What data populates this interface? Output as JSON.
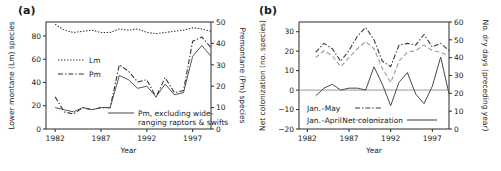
{
  "figure": {
    "panels": [
      {
        "label": "(a)",
        "xlabel": "Year",
        "y_left_label": "Lower montane (Lm) species",
        "y_right_label": "Premontane (Pm) species"
      },
      {
        "label": "(b)",
        "xlabel": "Year",
        "y_left_label": "Net colonization (no. species)",
        "y_right_label": "No. dry days (preceding year)"
      }
    ]
  },
  "chart_data": [
    {
      "type": "line",
      "title": "(a)",
      "xlabel": "Year",
      "ylabel": "Lower montane (Lm) species",
      "y2label": "Premontane (Pm) species",
      "xlim": [
        1981,
        1999
      ],
      "ylim": [
        0,
        92
      ],
      "y2lim": [
        0,
        50
      ],
      "xticks": [
        1982,
        1987,
        1992,
        1997
      ],
      "yticks": [
        0,
        20,
        40,
        60,
        80
      ],
      "y2ticks": [
        0,
        10,
        20,
        30,
        40,
        50
      ],
      "grid": false,
      "legend_position": "upper-left",
      "x": [
        1982,
        1983,
        1984,
        1985,
        1986,
        1987,
        1988,
        1989,
        1990,
        1991,
        1992,
        1993,
        1994,
        1995,
        1996,
        1997,
        1998
      ],
      "series": [
        {
          "name": "Lm",
          "axis": "left",
          "style": "dotted",
          "color": "#333333",
          "values": [
            90,
            85,
            83,
            84,
            85,
            83,
            83,
            86,
            85,
            86,
            83,
            82,
            83,
            84,
            85,
            87,
            86,
            84
          ]
        },
        {
          "name": "Pm",
          "axis": "right",
          "style": "dash-dot",
          "color": "#333333",
          "values": [
            15,
            8,
            7,
            10,
            9,
            10,
            10,
            30,
            27,
            22,
            23,
            15,
            24,
            17,
            18,
            41,
            43,
            38
          ]
        },
        {
          "name": "Pm, excluding wide-ranging raptors & swifts",
          "axis": "right",
          "style": "solid",
          "color": "#555555",
          "values": [
            10,
            9,
            8,
            10,
            9,
            10,
            10,
            25,
            23,
            19,
            20,
            15,
            21,
            16,
            17,
            34,
            39,
            34
          ]
        }
      ],
      "legend_entries": [
        "Lm",
        "Pm",
        "Pm, excluding wide-ranging raptors & swifts"
      ]
    },
    {
      "type": "line",
      "title": "(b)",
      "xlabel": "Year",
      "ylabel": "Net colonization (no. species)",
      "y2label": "No. dry days (preceding year)",
      "xlim": [
        1981,
        1999
      ],
      "ylim": [
        -20,
        35
      ],
      "y2lim": [
        0,
        60
      ],
      "xticks": [
        1982,
        1987,
        1992,
        1997
      ],
      "yticks": [
        -20,
        -10,
        0,
        10,
        20,
        30
      ],
      "y2ticks": [
        0,
        10,
        20,
        30,
        40,
        50,
        60
      ],
      "grid": false,
      "legend_position": "lower-left",
      "x": [
        1983,
        1984,
        1985,
        1986,
        1987,
        1988,
        1989,
        1990,
        1991,
        1992,
        1993,
        1994,
        1995,
        1996,
        1997,
        1998
      ],
      "series": [
        {
          "name": "Jan.-May",
          "axis": "right",
          "style": "dash-dot",
          "color": "#3a3a3a",
          "values": [
            43,
            48,
            45,
            38,
            44,
            52,
            57,
            50,
            38,
            35,
            47,
            48,
            47,
            53,
            46,
            48,
            44,
            39
          ]
        },
        {
          "name": "Jan.-April",
          "axis": "right",
          "style": "dashed",
          "color": "#9b9b9b",
          "values": [
            40,
            44,
            41,
            35,
            40,
            45,
            49,
            45,
            34,
            26,
            38,
            43,
            44,
            47,
            44,
            43,
            41,
            37
          ]
        },
        {
          "name": "Net colonization",
          "axis": "left",
          "style": "solid",
          "color": "#4a4a4a",
          "values": [
            -3,
            1,
            3,
            0,
            1,
            1,
            0,
            12,
            3,
            -8,
            4,
            9,
            -2,
            -7,
            2,
            17,
            -2,
            7,
            -5
          ]
        }
      ],
      "legend_entries": [
        "Jan.-May",
        "Jan.-April",
        "Net colonization"
      ]
    }
  ]
}
